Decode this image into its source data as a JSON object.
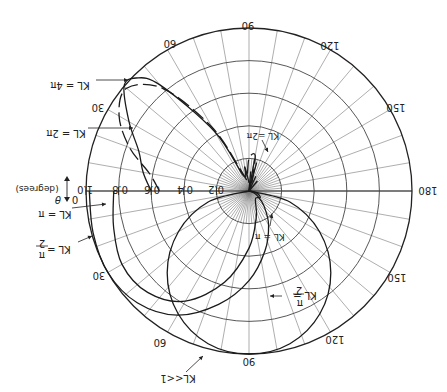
{
  "chart_data": {
    "type": "polar",
    "title": "",
    "orientation_note": "figure rendered rotated 180 degrees",
    "radial_axis": {
      "label": "",
      "ticks": [
        0.2,
        0.4,
        0.6,
        0.8,
        1.0
      ],
      "tick_labels": [
        "0.2",
        "0.4",
        "0.6",
        "0.8",
        "1.0"
      ],
      "range": [
        0,
        1.0
      ]
    },
    "angular_axis": {
      "label": "θ (degrees)",
      "zero_label": "0",
      "ticks": [
        0,
        30,
        60,
        90,
        120,
        150,
        180
      ],
      "tick_labels": [
        "30",
        "60",
        "90",
        "120",
        "150",
        "180"
      ],
      "grid_step_deg": 10
    },
    "series": [
      {
        "name": "KL<<1",
        "style": "solid",
        "description": "sin(θ) dipole-like pattern, max 1.0 at 90°",
        "theta_deg": [
          0,
          15,
          30,
          45,
          60,
          75,
          90,
          105,
          120,
          135,
          150,
          165,
          180
        ],
        "r": [
          0,
          0.26,
          0.5,
          0.71,
          0.87,
          0.97,
          1.0,
          0.97,
          0.87,
          0.71,
          0.5,
          0.26,
          0
        ]
      },
      {
        "name": "KL = π/2",
        "style": "solid",
        "theta_deg": [
          0,
          15,
          30,
          45,
          60,
          75,
          90,
          105,
          120,
          135,
          150,
          165,
          180
        ],
        "r": [
          0.98,
          0.99,
          1.0,
          0.97,
          0.88,
          0.72,
          0.55,
          0.38,
          0.24,
          0.13,
          0.06,
          0.02,
          0
        ]
      },
      {
        "name": "KL = π",
        "style": "solid",
        "theta_deg": [
          0,
          15,
          30,
          45,
          60,
          75,
          90,
          105,
          120,
          135,
          150,
          165,
          180
        ],
        "r": [
          0.83,
          0.86,
          0.9,
          0.88,
          0.78,
          0.58,
          0.35,
          0.17,
          0.08,
          0.06,
          0.08,
          0.05,
          0
        ]
      },
      {
        "name": "KL = 2π",
        "style": "dashed",
        "theta_deg": [
          0,
          10,
          20,
          30,
          40,
          50,
          60,
          70,
          80,
          90,
          100,
          110
        ],
        "r": [
          0.55,
          0.62,
          0.78,
          0.92,
          0.98,
          0.82,
          0.45,
          0.12,
          0.08,
          0.2,
          0.22,
          0.05
        ]
      },
      {
        "name": "KL = 4π",
        "style": "solid",
        "theta_deg": [
          0,
          10,
          20,
          30,
          40,
          45,
          50,
          60,
          70,
          80,
          90
        ],
        "r": [
          0.6,
          0.66,
          0.72,
          0.85,
          1.0,
          0.98,
          0.85,
          0.42,
          0.1,
          0.15,
          0.05
        ]
      }
    ],
    "annotations": [
      "KL<<1",
      "KL = π/2",
      "KL = π",
      "KL = 2π",
      "KL = 4π",
      "KL = π",
      "KL = π/2",
      "KL = 2π"
    ],
    "grid": true,
    "legend": "none (inline arrow annotations)"
  },
  "labels": {
    "radial": [
      "0.2",
      "0.4",
      "0.6",
      "0.8",
      "1.0"
    ],
    "zero": "0",
    "theta": "θ",
    "degrees": "(degrees)",
    "angle_top_left": "60",
    "angle_top": "90",
    "angle_top_right": "120",
    "angle_right_upper": "150",
    "angle_right": "180",
    "angle_left_upper": "30",
    "angle_left_lower": "30",
    "angle_bottom_left": "60",
    "angle_bottom": "90",
    "angle_bottom_right": "120",
    "angle_right_lower": "150",
    "kl_4pi": "KL = 4π",
    "kl_2pi_left": "KL = 2π",
    "kl_pi_left": "KL = π",
    "kl_pi2_left_a": "KL =",
    "kl_pi2_left_b": "π",
    "kl_pi2_left_c": "2",
    "kl_much_less": "KL<<1",
    "kl_2pi_center": "KL =2π",
    "kl_pi_center": "KL = π",
    "kl_pi2_right_a": "KL =",
    "kl_pi2_right_b": "π",
    "kl_pi2_right_c": "2"
  }
}
